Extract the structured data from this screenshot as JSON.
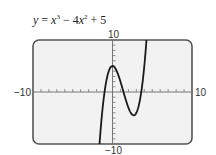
{
  "chart_data": {
    "type": "line",
    "title_parts": {
      "lhs": "y",
      "eq": " = ",
      "t1": "x",
      "e1": "3",
      "op1": " − 4",
      "t2": "x",
      "e2": "2",
      "op2": " + 5"
    },
    "function": "x^3 - 4x^2 + 5",
    "coefficients": {
      "x3": 1,
      "x2": -4,
      "x1": 0,
      "x0": 5
    },
    "xlim": [
      -10,
      10
    ],
    "ylim": [
      -10,
      10
    ],
    "xscale": 1,
    "yscale": 1,
    "xlabel": "",
    "ylabel": "",
    "tick_labels": {
      "xmin": "−10",
      "xmax": "10",
      "ymin": "−10",
      "ymax": "10"
    },
    "grid": false,
    "legend": "none",
    "series": [
      {
        "name": "y = x^3 - 4x^2 + 5",
        "color": "#1a1a1a"
      }
    ],
    "key_points": {
      "local_max": [
        0,
        5
      ],
      "local_min": [
        2.667,
        -4.48
      ]
    }
  },
  "colors": {
    "frame": "#555555",
    "plot_bg": "#f2f2f2",
    "axis": "#777777",
    "curve": "#1a1a1a"
  }
}
